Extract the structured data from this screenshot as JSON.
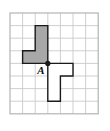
{
  "figure": {
    "type": "geometry-rotation-diagram",
    "label_point_a": "A",
    "grid": {
      "columns": 7,
      "rows": 8,
      "cell_size": 12.6,
      "origin_x": 10,
      "origin_y": 13,
      "line_color": "#c9c9c9",
      "border_color": "#b4b4b4",
      "background": "#ffffff"
    },
    "point_a": {
      "label": "A",
      "grid_x": 3,
      "grid_y": 4,
      "dot_color": "#1a1a1a",
      "dot_radius": 2.6,
      "label_color": "#111111"
    },
    "shapes": [
      {
        "name": "gray-l-polygon",
        "fill": "#a8a8a8",
        "stroke": "#1a1a1a",
        "stroke_width": 1.4,
        "points_grid": [
          [
            2,
            1
          ],
          [
            3,
            1
          ],
          [
            3,
            4
          ],
          [
            1,
            4
          ],
          [
            1,
            3
          ],
          [
            2,
            3
          ]
        ]
      },
      {
        "name": "white-rotated-l-polygon",
        "fill": "#ffffff",
        "stroke": "#1a1a1a",
        "stroke_width": 1.4,
        "points_grid": [
          [
            4,
            7
          ],
          [
            3,
            7
          ],
          [
            3,
            4
          ],
          [
            5,
            4
          ],
          [
            5,
            5
          ],
          [
            4,
            5
          ]
        ]
      }
    ]
  }
}
